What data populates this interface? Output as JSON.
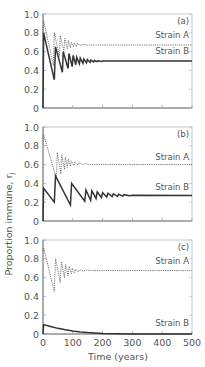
{
  "chart_data": [
    {
      "type": "line",
      "panel_label": "(a)",
      "xlim": [
        0,
        500
      ],
      "ylim": [
        0,
        1.0
      ],
      "yticks": [
        "0",
        "0.2",
        "0.4",
        "0.6",
        "0.8",
        "1.0"
      ],
      "ytick_values": [
        0,
        0.2,
        0.4,
        0.6,
        0.8,
        1.0
      ],
      "xticks": [
        0,
        100,
        200,
        300,
        400,
        500
      ],
      "show_xtick_labels": false,
      "series": [
        {
          "name": "Strain A",
          "style": "dotted",
          "x": [
            0,
            2,
            35,
            38,
            55,
            58,
            70,
            73,
            82,
            85,
            92,
            95,
            102,
            105,
            112,
            115,
            125,
            135,
            150,
            500
          ],
          "y": [
            0.8,
            0.93,
            0.45,
            0.8,
            0.55,
            0.77,
            0.6,
            0.74,
            0.63,
            0.72,
            0.64,
            0.7,
            0.65,
            0.69,
            0.655,
            0.685,
            0.665,
            0.675,
            0.67,
            0.67
          ],
          "label": "Strain A",
          "label_y": 0.75
        },
        {
          "name": "Strain B",
          "style": "solid",
          "x": [
            0,
            2,
            38,
            42,
            65,
            68,
            84,
            87,
            98,
            101,
            110,
            113,
            122,
            125,
            134,
            137,
            146,
            149,
            158,
            161,
            170,
            173,
            182,
            185,
            195,
            200,
            500
          ],
          "y": [
            0,
            0.8,
            0.3,
            0.65,
            0.38,
            0.6,
            0.42,
            0.58,
            0.44,
            0.56,
            0.46,
            0.54,
            0.47,
            0.53,
            0.475,
            0.52,
            0.48,
            0.515,
            0.485,
            0.51,
            0.49,
            0.505,
            0.493,
            0.502,
            0.495,
            0.5,
            0.5
          ],
          "label": "Strain B",
          "label_y": 0.57
        }
      ]
    },
    {
      "type": "line",
      "panel_label": "(b)",
      "xlim": [
        0,
        500
      ],
      "ylim": [
        0,
        1.0
      ],
      "yticks": [
        "0",
        "0.2",
        "0.4",
        "0.6",
        "0.8",
        "1.0"
      ],
      "ytick_values": [
        0,
        0.2,
        0.4,
        0.6,
        0.8,
        1.0
      ],
      "xticks": [
        0,
        100,
        200,
        300,
        400,
        500
      ],
      "show_xtick_labels": false,
      "series": [
        {
          "name": "Strain A",
          "style": "dotted",
          "x": [
            0,
            2,
            45,
            48,
            60,
            63,
            72,
            75,
            82,
            85,
            92,
            95,
            104,
            107,
            118,
            121,
            135,
            140,
            160,
            500
          ],
          "y": [
            0.85,
            0.92,
            0.45,
            0.73,
            0.5,
            0.7,
            0.55,
            0.68,
            0.57,
            0.66,
            0.58,
            0.64,
            0.59,
            0.63,
            0.595,
            0.62,
            0.6,
            0.61,
            0.6,
            0.6
          ],
          "label": "Strain A",
          "label_y": 0.65
        },
        {
          "name": "Strain B",
          "style": "solid",
          "x": [
            0,
            2,
            38,
            42,
            92,
            96,
            140,
            144,
            160,
            164,
            178,
            182,
            196,
            200,
            214,
            218,
            232,
            236,
            250,
            254,
            268,
            272,
            290,
            300,
            500
          ],
          "y": [
            0,
            0.35,
            0.2,
            0.48,
            0.17,
            0.4,
            0.21,
            0.33,
            0.22,
            0.32,
            0.24,
            0.31,
            0.25,
            0.3,
            0.255,
            0.295,
            0.26,
            0.29,
            0.262,
            0.285,
            0.265,
            0.28,
            0.27,
            0.275,
            0.272
          ],
          "label": "Strain B",
          "label_y": 0.33
        }
      ]
    },
    {
      "type": "line",
      "panel_label": "(c)",
      "xlim": [
        0,
        500
      ],
      "ylim": [
        0,
        1.0
      ],
      "yticks": [
        "0",
        "0.2",
        "0.4",
        "0.6",
        "0.8",
        "1.0"
      ],
      "ytick_values": [
        0,
        0.2,
        0.4,
        0.6,
        0.8,
        1.0
      ],
      "xticks": [
        0,
        100,
        200,
        300,
        400,
        500
      ],
      "show_xtick_labels": true,
      "xlabel": "Time (years)",
      "series": [
        {
          "name": "Strain A",
          "style": "dotted",
          "x": [
            0,
            2,
            38,
            42,
            58,
            62,
            72,
            76,
            84,
            88,
            95,
            99,
            106,
            110,
            118,
            122,
            135,
            145,
            165,
            500
          ],
          "y": [
            0.88,
            0.92,
            0.45,
            0.8,
            0.55,
            0.77,
            0.6,
            0.74,
            0.62,
            0.72,
            0.64,
            0.7,
            0.65,
            0.69,
            0.66,
            0.685,
            0.67,
            0.68,
            0.675,
            0.675
          ],
          "label": "Strain A",
          "label_y": 0.74
        },
        {
          "name": "Strain B",
          "style": "solid",
          "x": [
            0,
            2,
            25,
            50,
            75,
            100,
            125,
            150,
            175,
            200,
            250,
            300,
            400,
            500
          ],
          "y": [
            0,
            0.1,
            0.08,
            0.06,
            0.045,
            0.032,
            0.022,
            0.015,
            0.01,
            0.006,
            0.003,
            0.001,
            0.0,
            0.0
          ],
          "label": "Strain B",
          "label_y": 0.08
        }
      ]
    }
  ],
  "shared": {
    "ylabel": "Proportion immune, r",
    "ylabel_subscript": "j",
    "xlabel": "Time (years)"
  }
}
